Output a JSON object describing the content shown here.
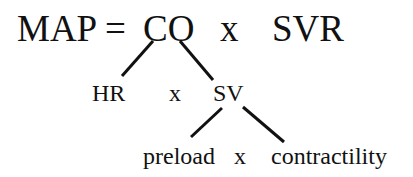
{
  "equation": {
    "lhs": "MAP =",
    "term1": "CO",
    "op1": "x",
    "term2": "SVR"
  },
  "co_breakdown": {
    "term1": "HR",
    "op": "x",
    "term2": "SV"
  },
  "sv_breakdown": {
    "term1": "preload",
    "op": "x",
    "term2": "contractility"
  },
  "colors": {
    "text": "#111111",
    "lines": "#111111",
    "background": "#ffffff"
  }
}
